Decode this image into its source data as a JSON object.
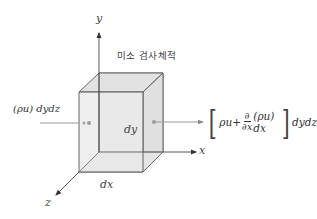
{
  "diagram": {
    "title_label": "미소 검사체적",
    "axes": {
      "x": "x",
      "y": "y",
      "z": "z"
    },
    "dimensions": {
      "dx": "dx",
      "dy": "dy"
    },
    "inflow": {
      "label": "(ρu) dydz"
    },
    "outflow": {
      "open_bracket": "[",
      "term1": "ρu+",
      "frac_num": "∂",
      "frac_den": "∂x",
      "term2": "(ρu) dx",
      "close_bracket": "]",
      "suffix": "dydz"
    },
    "colors": {
      "cube_fill": "#e6e6e6",
      "cube_edge": "#555555",
      "axis": "#444444",
      "flux_arrow": "#9a9a9a",
      "dot": "#9a9a9a"
    }
  }
}
